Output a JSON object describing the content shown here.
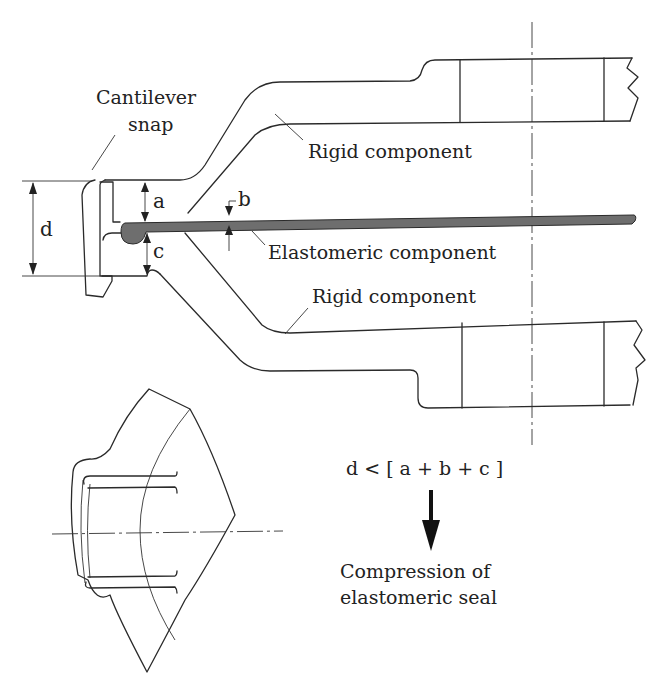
{
  "diagram": {
    "labels": {
      "cantilever_line1": "Cantilever",
      "cantilever_line2": "snap",
      "rigid_top": "Rigid component",
      "elastomeric": "Elastomeric component",
      "rigid_bottom": "Rigid component"
    },
    "dimensions": {
      "a": "a",
      "b": "b",
      "c": "c",
      "d": "d"
    },
    "formula": "d < [ a + b + c ]",
    "result_line1": "Compression of",
    "result_line2": "elastomeric  seal",
    "colors": {
      "line": "#2a2a2a",
      "elastomer_fill": "#6e6e6e",
      "background": "#ffffff"
    }
  }
}
